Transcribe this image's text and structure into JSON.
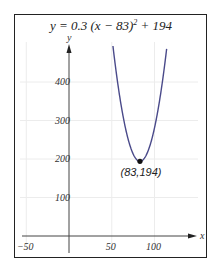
{
  "chart_data": {
    "type": "line",
    "title_parts": {
      "pre": "y = 0.3 (x − 83)",
      "exp": "2",
      "post": " + 194"
    },
    "equation": {
      "a": 0.3,
      "h": 83,
      "k": 194
    },
    "xlabel": "x",
    "ylabel": "y",
    "xlim": [
      -50,
      150
    ],
    "ylim": [
      -20,
      500
    ],
    "x_ticks": [
      {
        "value": -50,
        "label": "−50"
      },
      {
        "value": 50,
        "label": "50"
      },
      {
        "value": 100,
        "label": "100"
      }
    ],
    "y_ticks": [
      {
        "value": 100,
        "label": "100"
      },
      {
        "value": 200,
        "label": "200"
      },
      {
        "value": 300,
        "label": "300"
      },
      {
        "value": 400,
        "label": "400"
      }
    ],
    "grid": true,
    "series": [
      {
        "name": "parabola",
        "color": "#4a4a8a",
        "x": [
          52,
          55,
          60,
          65,
          70,
          75,
          80,
          83,
          86,
          91,
          96,
          101,
          106,
          111,
          114
        ],
        "values": [
          482.3,
          429.2,
          352.7,
          291.2,
          244.7,
          213.2,
          196.7,
          194,
          196.7,
          213.2,
          244.7,
          291.2,
          352.7,
          429.2,
          482.3
        ]
      }
    ],
    "annotations": [
      {
        "x": 83,
        "y": 194,
        "label": "(83,194)",
        "marker": "dot"
      }
    ]
  }
}
